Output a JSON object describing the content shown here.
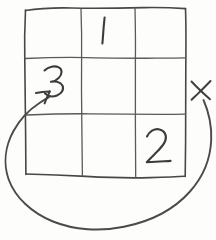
{
  "canvas": {
    "width": 216,
    "height": 240,
    "background_color": "#fdfdfc",
    "ink_color": "#474747",
    "description": "Hand-drawn pencil sketch of a 3-by-3 grid with handwritten digits and a large looping arrow"
  },
  "grid": {
    "name": "hand-drawn-3x3-grid",
    "rows": 3,
    "columns": 3,
    "left": 25,
    "top": 8,
    "right": 186,
    "bottom": 176,
    "column_dividers_x": [
      82,
      135
    ],
    "row_dividers_y": [
      58,
      114
    ],
    "cells": [
      {
        "id": "cell-r1c1",
        "row": 1,
        "col": 1,
        "label": ""
      },
      {
        "id": "cell-r1c2",
        "row": 1,
        "col": 2,
        "label": "1"
      },
      {
        "id": "cell-r1c3",
        "row": 1,
        "col": 3,
        "label": ""
      },
      {
        "id": "cell-r2c1",
        "row": 2,
        "col": 1,
        "label": "3"
      },
      {
        "id": "cell-r2c2",
        "row": 2,
        "col": 2,
        "label": ""
      },
      {
        "id": "cell-r2c3",
        "row": 2,
        "col": 3,
        "label": ""
      },
      {
        "id": "cell-r3c1",
        "row": 3,
        "col": 1,
        "label": ""
      },
      {
        "id": "cell-r3c2",
        "row": 3,
        "col": 2,
        "label": ""
      },
      {
        "id": "cell-r3c3",
        "row": 3,
        "col": 3,
        "label": "2"
      }
    ]
  },
  "annotations": {
    "digit_one": {
      "name": "handwritten-digit-1",
      "text": "1",
      "x": 103,
      "y": 30,
      "cell": "cell-r1c2"
    },
    "digit_three": {
      "name": "handwritten-digit-3",
      "text": "3",
      "x": 56,
      "y": 82,
      "cell": "cell-r2c1"
    },
    "digit_two": {
      "name": "handwritten-digit-2",
      "text": "2",
      "x": 158,
      "y": 145,
      "cell": "cell-r3c3"
    },
    "x_mark": {
      "name": "x-mark",
      "symbol": "X",
      "x": 200,
      "y": 90,
      "meaning": "start point marker outside grid, right side"
    },
    "loop_arrow": {
      "name": "loop-arrow",
      "from": "x-mark",
      "to": "cell-r2c1",
      "direction": "counter-clockwise sweep below the grid",
      "arrowhead_tip_x": 50,
      "arrowhead_tip_y": 92,
      "lowest_point_y": 229
    }
  }
}
